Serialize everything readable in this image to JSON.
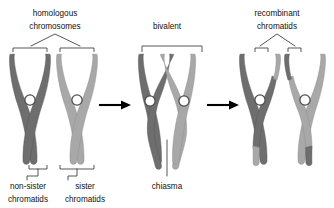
{
  "figure": {
    "background_color": "#ffffff"
  },
  "colors": {
    "chromatid_dark": "#6e6e6e",
    "chromatid_light": "#a8a8a8",
    "centromere_fill": "#ffffff",
    "centromere_stroke": "#4a4a4a",
    "arrow": "#000000",
    "text": "#111111",
    "bracket": "#3a3a3a"
  },
  "labels": {
    "homologous_line1": "homologous",
    "homologous_line2": "chromosomes",
    "bivalent": "bivalent",
    "recombinant_line1": "recombinant",
    "recombinant_line2": "chromatids",
    "nonsister_line1": "non-sister",
    "nonsister_line2": "chromatids",
    "sister_line1": "sister",
    "sister_line2": "chromatids",
    "chiasma": "chiasma"
  },
  "panels": [
    {
      "id": "panel-homologous",
      "label": "homologous chromosomes",
      "chromosomes": [
        {
          "id": "chromosome-maternal",
          "shade": "dark"
        },
        {
          "id": "chromosome-paternal",
          "shade": "light"
        }
      ],
      "annotations": [
        "non-sister chromatids",
        "sister chromatids"
      ]
    },
    {
      "id": "panel-bivalent",
      "label": "bivalent",
      "chromosomes": [
        {
          "id": "chromosome-maternal",
          "shade": "dark"
        },
        {
          "id": "chromosome-paternal",
          "shade": "light"
        }
      ],
      "annotations": [
        "chiasma"
      ]
    },
    {
      "id": "panel-recombinant",
      "label": "recombinant chromatids",
      "chromosomes": [
        {
          "id": "chromosome-recombinant-1",
          "shade": "dark",
          "recombinant_arm": "light"
        },
        {
          "id": "chromosome-recombinant-2",
          "shade": "light",
          "recombinant_arm": "dark"
        }
      ],
      "annotations": [
        "recombinant chromatids"
      ]
    }
  ],
  "arrows": [
    {
      "id": "arrow-1",
      "from": "panel-homologous",
      "to": "panel-bivalent",
      "direction": "right"
    },
    {
      "id": "arrow-2",
      "from": "panel-bivalent",
      "to": "panel-recombinant",
      "direction": "right"
    }
  ]
}
